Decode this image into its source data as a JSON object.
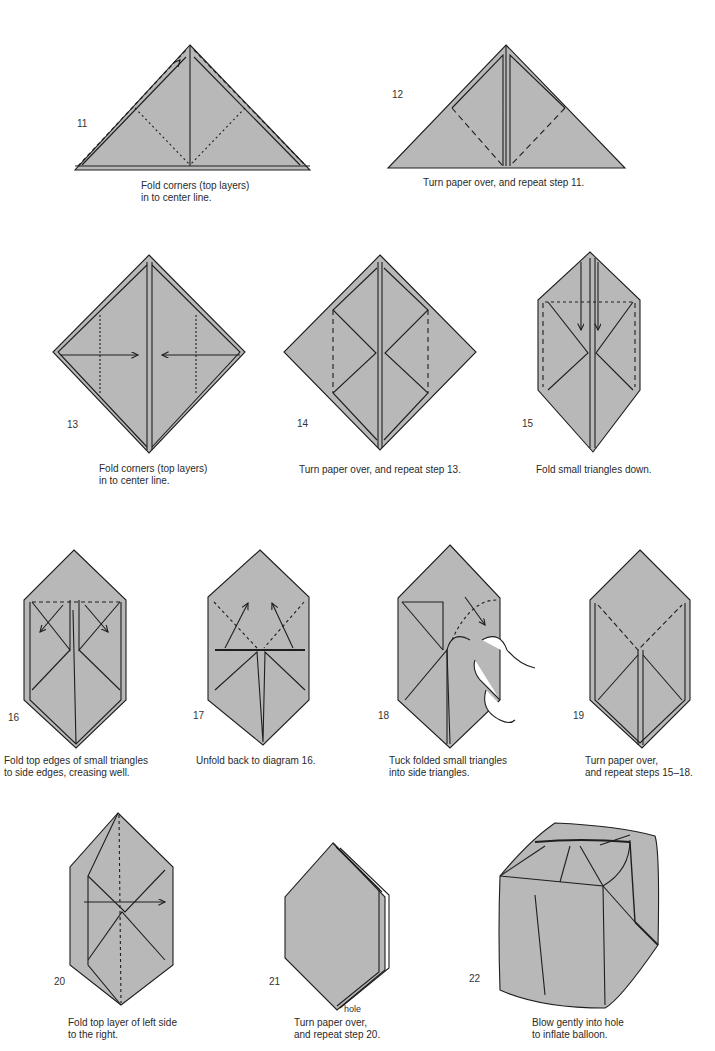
{
  "page": {
    "fill_color": "#b8b8b8",
    "line_color": "#1e1e1e"
  },
  "steps": [
    {
      "number": "11",
      "caption_lines": [
        "Fold corners (top layers)",
        "in to center line."
      ]
    },
    {
      "number": "12",
      "caption_lines": [
        "Turn paper over, and repeat step 11."
      ]
    },
    {
      "number": "13",
      "caption_lines": [
        "Fold corners (top layers)",
        "in to center line."
      ]
    },
    {
      "number": "14",
      "caption_lines": [
        "Turn paper over, and repeat step 13."
      ]
    },
    {
      "number": "15",
      "caption_lines": [
        "Fold small triangles down."
      ]
    },
    {
      "number": "16",
      "caption_lines": [
        "Fold top edges of small triangles",
        "to side edges, creasing well."
      ]
    },
    {
      "number": "17",
      "caption_lines": [
        "Unfold back to diagram 16."
      ]
    },
    {
      "number": "18",
      "caption_lines": [
        "Tuck folded small triangles",
        "into side triangles."
      ]
    },
    {
      "number": "19",
      "caption_lines": [
        "Turn paper over,",
        "and repeat steps 15–18."
      ]
    },
    {
      "number": "20",
      "caption_lines": [
        "Fold top layer of left side",
        "to the right."
      ]
    },
    {
      "number": "21",
      "caption_lines": [
        "Turn paper over,",
        "and repeat step 20."
      ],
      "annotation": "hole"
    },
    {
      "number": "22",
      "caption_lines": [
        "Blow gently into hole",
        "to inflate balloon."
      ]
    }
  ]
}
